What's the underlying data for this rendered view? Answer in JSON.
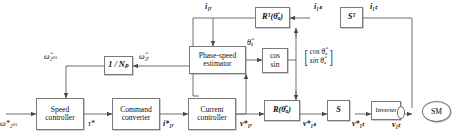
{
  "figure": {
    "type": "control-block-diagram",
    "stroke_color": "#6f6f6f",
    "text_color": "#111111",
    "background": "#ffffff"
  },
  "blocks": {
    "speed_controller": "Speed\ncontroller",
    "command_converter": "Command\nconverter",
    "current_controller": "Current\ncontroller",
    "phase_speed_estimator": "Phase-speed\nestimator",
    "pole_pairs": "1 / Nₚ",
    "cos_sin": "cos\nsin",
    "rotation_transpose": "Rᵀ(θ̂ₐ)",
    "rotation": "R(θ̂ₐ)",
    "s_transpose": "Sᵀ",
    "s_matrix": "S",
    "inverter": "Inverter",
    "machine": "SM",
    "trig_vector_row1": "cos θ̂ₐ",
    "trig_vector_row2": "sin θ̂ₐ"
  },
  "signals": {
    "speed_reference": "ω*₂ₘ",
    "speed_estimate_mech": "ω̂₂ₘ",
    "speed_estimate_elec": "ω̂₂ᵣ",
    "torque_reference": "τ*",
    "current_reference_rotor": "i*₁ᵣ",
    "voltage_reference_rotor": "v*₁ᵣ",
    "voltage_reference_stator": "v*₁ₛ",
    "voltage_reference_terminal": "v*₁ₜ",
    "voltage_terminal": "v₁ₜ",
    "current_rotor": "i₁ᵣ",
    "current_stator": "i₁ₛ",
    "current_terminal": "i₁ₜ",
    "angle_estimate": "θ̂ₐ"
  },
  "flow": {
    "forward_path": [
      "ω*₂ₘ",
      "Speed controller",
      "τ*",
      "Command converter",
      "i*₁ᵣ",
      "Current controller",
      "v*₁ᵣ",
      "R(θ̂ₐ)",
      "v*₁ₛ",
      "S",
      "v*₁ₜ",
      "Inverter",
      "v₁ₜ",
      "SM"
    ],
    "feedback_path": [
      "i₁ₜ",
      "Sᵀ",
      "i₁ₛ",
      "Rᵀ(θ̂ₐ)",
      "i₁ᵣ",
      "Current controller / Phase-speed estimator"
    ],
    "estimator_path": [
      "Phase-speed estimator",
      "θ̂ₐ",
      "cos/sin",
      "[cos θ̂ₐ ; sin θ̂ₐ]"
    ],
    "speed_feedback_path": [
      "Phase-speed estimator",
      "ω̂₂ᵣ",
      "1 / Nₚ",
      "ω̂₂ₘ",
      "Speed controller"
    ]
  }
}
